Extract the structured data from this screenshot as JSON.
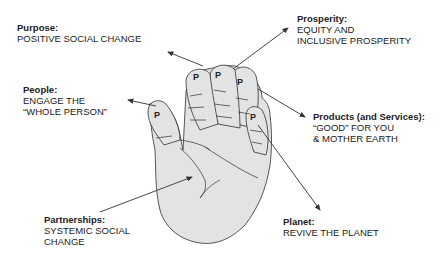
{
  "diagram": {
    "hand_letter": "P",
    "fill_color": "#e3e3e3",
    "line_color": "#444444",
    "labels": {
      "purpose": {
        "head": "Purpose:",
        "lines": [
          "POSITIVE SOCIAL CHANGE"
        ]
      },
      "prosperity": {
        "head": "Prosperity:",
        "lines": [
          "EQUITY AND",
          "INCLUSIVE PROSPERITY"
        ]
      },
      "people": {
        "head": "People:",
        "lines": [
          "ENGAGE THE",
          "“WHOLE PERSON”"
        ]
      },
      "products": {
        "head": "Products (and Services):",
        "lines": [
          "“GOOD” FOR YOU",
          "& MOTHER EARTH"
        ]
      },
      "partnerships": {
        "head": "Partnerships:",
        "lines": [
          "SYSTEMIC SOCIAL",
          "CHANGE"
        ]
      },
      "planet": {
        "head": "Planet:",
        "lines": [
          "REVIVE THE PLANET"
        ]
      }
    }
  }
}
